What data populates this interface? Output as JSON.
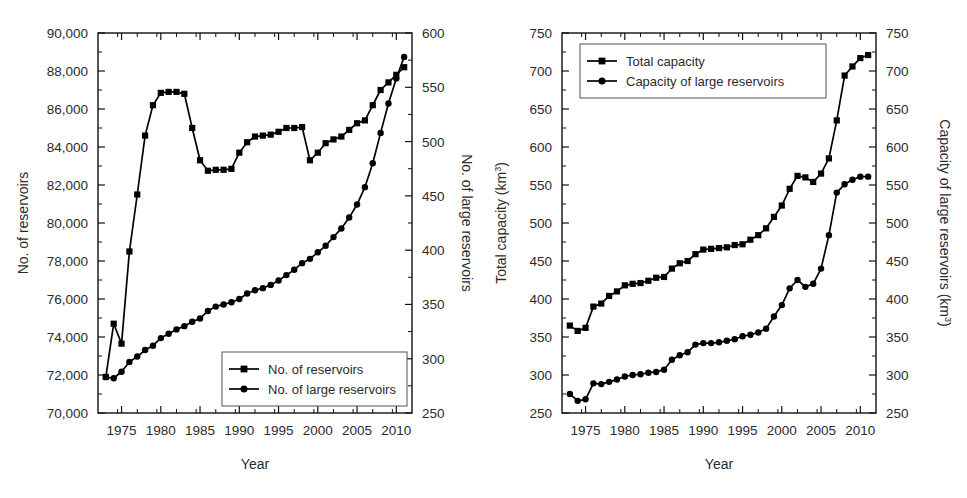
{
  "figure": {
    "background": "#ffffff",
    "ink": "#000000",
    "panel_count": 2
  },
  "chart_data": [
    {
      "type": "line",
      "panel": "left",
      "title": "",
      "xlabel": "Year",
      "ylabel": "No. of reservoirs",
      "ylabel_right": "No. of  large reservoirs",
      "xlim": [
        1972,
        2012
      ],
      "ylim": [
        70000,
        90000
      ],
      "ylim_right": [
        250,
        600
      ],
      "xticks": [
        1975,
        1980,
        1985,
        1990,
        1995,
        2000,
        2005,
        2010
      ],
      "xticklabels": [
        "1975",
        "1980",
        "1985",
        "1990",
        "1995",
        "2000",
        "2005",
        "2010"
      ],
      "yticks": [
        70000,
        72000,
        74000,
        76000,
        78000,
        80000,
        82000,
        84000,
        86000,
        88000,
        90000
      ],
      "yticklabels": [
        "70,000",
        "72,000",
        "74,000",
        "76,000",
        "78,000",
        "80,000",
        "82,000",
        "84,000",
        "86,000",
        "88,000",
        "90,000"
      ],
      "yticks_right": [
        250,
        300,
        350,
        400,
        450,
        500,
        550,
        600
      ],
      "yticklabels_right": [
        "250",
        "300",
        "350",
        "400",
        "450",
        "500",
        "550",
        "600"
      ],
      "grid": false,
      "legend_position": "lower-right",
      "series": [
        {
          "name": "No. of reservoirs",
          "marker": "square",
          "axis": "left",
          "x": [
            1973,
            1974,
            1975,
            1976,
            1977,
            1978,
            1979,
            1980,
            1981,
            1982,
            1983,
            1984,
            1985,
            1986,
            1987,
            1988,
            1989,
            1990,
            1991,
            1992,
            1993,
            1994,
            1995,
            1996,
            1997,
            1998,
            1999,
            2000,
            2001,
            2002,
            2003,
            2004,
            2005,
            2006,
            2007,
            2008,
            2009,
            2010,
            2011
          ],
          "values": [
            71900,
            74700,
            73650,
            78500,
            81500,
            84600,
            86200,
            86850,
            86900,
            86900,
            86800,
            85000,
            83300,
            82750,
            82800,
            82800,
            82850,
            83700,
            84250,
            84550,
            84600,
            84650,
            84800,
            85000,
            85000,
            85050,
            83300,
            83700,
            84200,
            84400,
            84550,
            84900,
            85250,
            85400,
            86200,
            87000,
            87400,
            87800,
            88200
          ]
        },
        {
          "name": "No. of large reservoirs",
          "marker": "circle",
          "axis": "right",
          "x": [
            1973,
            1974,
            1975,
            1976,
            1977,
            1978,
            1979,
            1980,
            1981,
            1982,
            1983,
            1984,
            1985,
            1986,
            1987,
            1988,
            1989,
            1990,
            1991,
            1992,
            1993,
            1994,
            1995,
            1996,
            1997,
            1998,
            1999,
            2000,
            2001,
            2002,
            2003,
            2004,
            2005,
            2006,
            2007,
            2008,
            2009,
            2010,
            2011
          ],
          "values": [
            283,
            282,
            288,
            297,
            302,
            308,
            312,
            319,
            323,
            327,
            330,
            334,
            337,
            344,
            348,
            350,
            352,
            355,
            360,
            363,
            365,
            368,
            372,
            377,
            382,
            388,
            392,
            398,
            404,
            412,
            420,
            430,
            442,
            458,
            480,
            508,
            535,
            558,
            578
          ]
        }
      ],
      "legend": [
        {
          "label": "No. of reservoirs",
          "marker": "square"
        },
        {
          "label": "No. of large reservoirs",
          "marker": "circle"
        }
      ]
    },
    {
      "type": "line",
      "panel": "right",
      "title": "",
      "xlabel": "Year",
      "ylabel": "Total capacity (km3)",
      "ylabel_right": "Capacity of large reservoirs (km3)",
      "ylabel_base": "Total capacity (km",
      "ylabel_sup": "3",
      "ylabel_tail": ")",
      "ylabel_right_base": "Capacity of large reservoirs (km",
      "ylabel_right_sup": "3",
      "ylabel_right_tail": ")",
      "xlim": [
        1972,
        2012
      ],
      "ylim": [
        250,
        750
      ],
      "ylim_right": [
        250,
        750
      ],
      "xticks": [
        1975,
        1980,
        1985,
        1990,
        1995,
        2000,
        2005,
        2010
      ],
      "xticklabels": [
        "1975",
        "1980",
        "1985",
        "1990",
        "1995",
        "2000",
        "2005",
        "2010"
      ],
      "yticks": [
        250,
        300,
        350,
        400,
        450,
        500,
        550,
        600,
        650,
        700,
        750
      ],
      "yticklabels": [
        "250",
        "300",
        "350",
        "400",
        "450",
        "500",
        "550",
        "600",
        "650",
        "700",
        "750"
      ],
      "yticks_right": [
        250,
        300,
        350,
        400,
        450,
        500,
        550,
        600,
        650,
        700,
        750
      ],
      "yticklabels_right": [
        "250",
        "300",
        "350",
        "400",
        "450",
        "500",
        "550",
        "600",
        "650",
        "700",
        "750"
      ],
      "grid": false,
      "legend_position": "upper-left",
      "series": [
        {
          "name": "Total capacity",
          "marker": "square",
          "axis": "left",
          "x": [
            1973,
            1974,
            1975,
            1976,
            1977,
            1978,
            1979,
            1980,
            1981,
            1982,
            1983,
            1984,
            1985,
            1986,
            1987,
            1988,
            1989,
            1990,
            1991,
            1992,
            1993,
            1994,
            1995,
            1996,
            1997,
            1998,
            1999,
            2000,
            2001,
            2002,
            2003,
            2004,
            2005,
            2006,
            2007,
            2008,
            2009,
            2010,
            2011
          ],
          "values": [
            365,
            358,
            362,
            390,
            394,
            404,
            410,
            418,
            420,
            421,
            424,
            428,
            429,
            440,
            447,
            450,
            459,
            465,
            466,
            467,
            468,
            471,
            472,
            478,
            484,
            493,
            508,
            523,
            545,
            562,
            560,
            554,
            565,
            585,
            635,
            694,
            706,
            717,
            721
          ]
        },
        {
          "name": "Capacity of large reservoirs",
          "marker": "circle",
          "axis": "right",
          "x": [
            1973,
            1974,
            1975,
            1976,
            1977,
            1978,
            1979,
            1980,
            1981,
            1982,
            1983,
            1984,
            1985,
            1986,
            1987,
            1988,
            1989,
            1990,
            1991,
            1992,
            1993,
            1994,
            1995,
            1996,
            1997,
            1998,
            1999,
            2000,
            2001,
            2002,
            2003,
            2004,
            2005,
            2006,
            2007,
            2008,
            2009,
            2010,
            2011
          ],
          "values": [
            275,
            266,
            268,
            289,
            288,
            291,
            294,
            298,
            300,
            301,
            303,
            304,
            307,
            320,
            326,
            330,
            340,
            342,
            342,
            343,
            345,
            347,
            351,
            353,
            356,
            361,
            377,
            392,
            414,
            425,
            416,
            420,
            440,
            484,
            540,
            551,
            557,
            561,
            561
          ]
        }
      ],
      "legend": [
        {
          "label": "Total capacity",
          "marker": "square"
        },
        {
          "label": "Capacity of large reservoirs",
          "marker": "circle"
        }
      ]
    }
  ]
}
